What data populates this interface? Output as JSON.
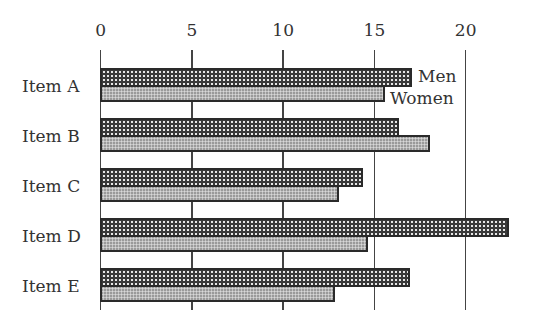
{
  "chart_data": {
    "type": "bar",
    "orientation": "horizontal",
    "title": "",
    "xlabel": "",
    "ylabel": "",
    "xlim": [
      0,
      22.5
    ],
    "x_ticks": [
      0,
      5,
      10,
      15,
      20
    ],
    "x_axis_position": "top",
    "grid": true,
    "categories": [
      "Item A",
      "Item B",
      "Item C",
      "Item D",
      "Item E"
    ],
    "series": [
      {
        "name": "Men",
        "values": [
          17.1,
          16.4,
          14.4,
          22.4,
          17.0
        ],
        "pattern": "dark-dotted"
      },
      {
        "name": "Women",
        "values": [
          15.6,
          18.1,
          13.1,
          14.7,
          12.9
        ],
        "pattern": "light-dotted"
      }
    ],
    "legend": {
      "position": "inline-right-of-first-bars",
      "entries": [
        "Men",
        "Women"
      ]
    }
  },
  "labels": {
    "ticks": [
      "0",
      "5",
      "10",
      "15",
      "20"
    ],
    "categories": [
      "Item A",
      "Item B",
      "Item C",
      "Item D",
      "Item E"
    ],
    "legend_men": "Men",
    "legend_women": "Women"
  }
}
